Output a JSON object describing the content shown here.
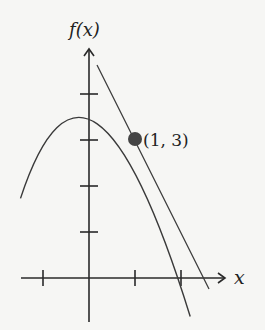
{
  "diagram": {
    "y_axis_label": "f(x)",
    "x_axis_label": "x",
    "point_label": "(1, 3)",
    "function": "f(x) = 4 - x^2",
    "tangent_line": "y = -2x + 5",
    "point": {
      "x": 1,
      "y": 3
    },
    "x_ticks": [
      -1,
      1,
      2
    ],
    "y_ticks": [
      1,
      2,
      3,
      4
    ],
    "colors": {
      "curve": "#3a3a3a",
      "axis": "#2a2a2a",
      "point": "#444444",
      "background": "#f6f6f4"
    }
  }
}
